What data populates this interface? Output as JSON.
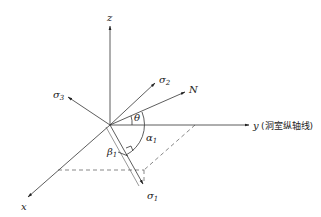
{
  "diagram": {
    "type": "3d-coordinate-stress-diagram",
    "axes": {
      "z": {
        "label": "z"
      },
      "y": {
        "label": "y",
        "note": "(洞室纵轴线)"
      },
      "x": {
        "label": "x"
      }
    },
    "vectors": {
      "sigma1": {
        "label": "σ",
        "sub": "1"
      },
      "sigma2": {
        "label": "σ",
        "sub": "2"
      },
      "sigma3": {
        "label": "σ",
        "sub": "3"
      },
      "N": {
        "label": "N"
      }
    },
    "angles": {
      "theta": {
        "label": "θ"
      },
      "alpha1": {
        "label": "α",
        "sub": "1"
      },
      "beta1": {
        "label": "β",
        "sub": "1"
      }
    },
    "colors": {
      "line": "#333333",
      "dashed": "#555555",
      "background": "#ffffff"
    }
  }
}
